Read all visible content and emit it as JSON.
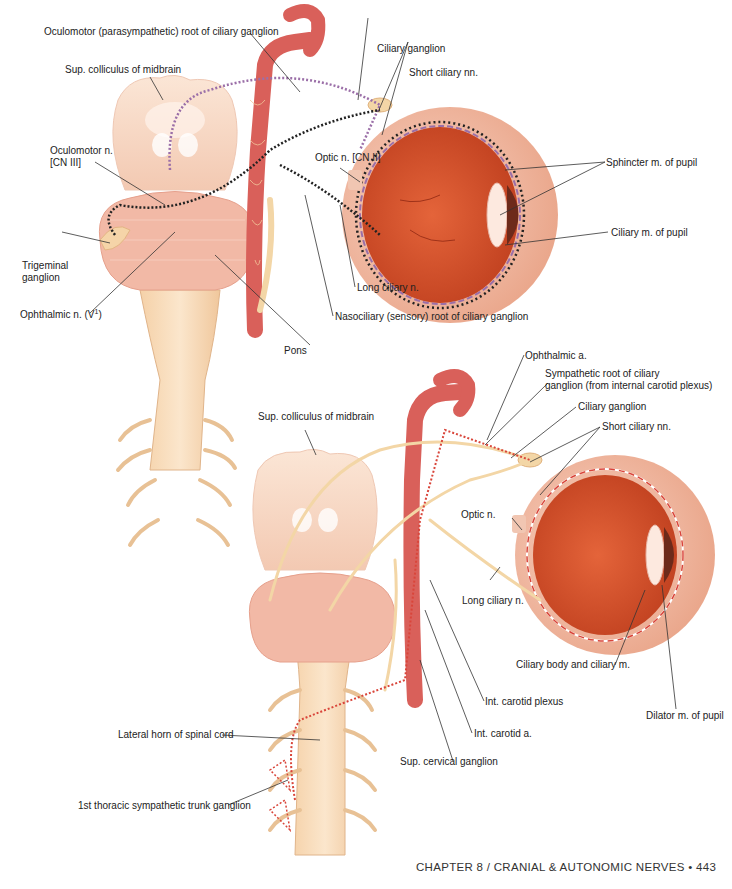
{
  "top_figure": {
    "labels": {
      "oculomotor_root": "Oculomotor (parasympathetic) root of ciliary ganglion",
      "sup_colliculus": "Sup. colliculus of midbrain",
      "oculomotor_n_line1": "Oculomotor n.",
      "oculomotor_n_line2": "[CN III]",
      "trigeminal_line1": "Trigeminal",
      "trigeminal_line2": "ganglion",
      "ophthalmic_n": "Ophthalmic n. (V",
      "ophthalmic_n_sup": "1",
      "ophthalmic_n_close": ")",
      "ciliary_ganglion": "Ciliary ganglion",
      "short_ciliary": "Short ciliary nn.",
      "optic_n": "Optic n. [CN II]",
      "sphincter": "Sphincter m. of pupil",
      "ciliary_m": "Ciliary m. of pupil",
      "long_ciliary": "Long ciliary n.",
      "nasociliary": "Nasociliary (sensory) root of ciliary ganglion",
      "pons": "Pons"
    }
  },
  "bottom_figure": {
    "labels": {
      "ophthalmic_a": "Ophthalmic a.",
      "sympathetic_root_line1": "Sympathetic root of ciliary",
      "sympathetic_root_line2": "ganglion (from internal carotid plexus)",
      "ciliary_ganglion": "Ciliary ganglion",
      "short_ciliary": "Short ciliary nn.",
      "sup_colliculus": "Sup. colliculus of midbrain",
      "optic_n": "Optic n.",
      "long_ciliary": "Long ciliary n.",
      "ciliary_body": "Ciliary body and ciliary m.",
      "dilator": "Dilator m. of pupil",
      "int_carotid_plexus": "Int. carotid plexus",
      "int_carotid_a": "Int. carotid a.",
      "lateral_horn": "Lateral horn of spinal cord",
      "sup_cervical": "Sup. cervical ganglion",
      "first_thoracic": "1st thoracic sympathetic trunk ganglion"
    }
  },
  "footer": {
    "running_head": "CHAPTER 8 / CRANIAL & AUTONOMIC NERVES • 443"
  },
  "colors": {
    "brainstem": "#f7dcc8",
    "pons": "#f2b7a8",
    "artery": "#d9605a",
    "eye_interior": "#d8522e",
    "nerve": "#f3d6a6",
    "parasympathetic_path": "#9b6fa8",
    "sensory_path": "#222222",
    "sympathetic_path": "#d9453a"
  }
}
